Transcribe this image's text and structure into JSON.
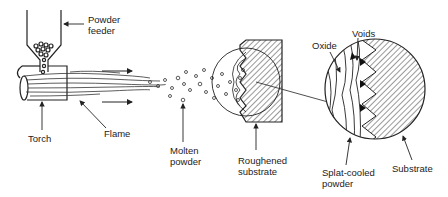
{
  "diagram": {
    "labels": {
      "powder_feeder": "Powder\nfeeder",
      "torch": "Torch",
      "flame": "Flame",
      "molten_powder": "Molten\npowder",
      "roughened_substrate": "Roughened\nsubstrate",
      "oxide": "Oxide",
      "voids": "Voids",
      "splat_cooled_powder": "Splat-cooled\npowder",
      "substrate": "Substrate"
    },
    "colors": {
      "ink": "#222222",
      "background": "#ffffff"
    }
  }
}
